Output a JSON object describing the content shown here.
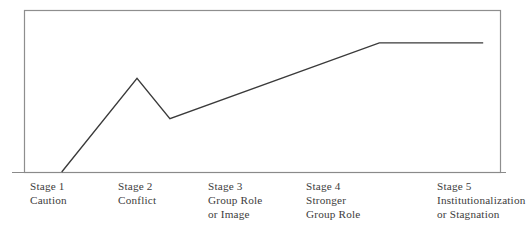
{
  "figure": {
    "background_color": "#ffffff",
    "frame_color": "#8e8e8e",
    "curve_color": "#3a3a3a",
    "axis_color": "#8a8a8a",
    "text_color": "#3d3c3c"
  },
  "chart_data": {
    "type": "line",
    "title": "",
    "subtitle": "",
    "xlabel": "",
    "ylabel": "",
    "grid": false,
    "legend": "none",
    "xlim": [
      0,
      5.5
    ],
    "ylim": [
      0,
      100
    ],
    "categories": [
      "Stage 1",
      "Stage 2",
      "Stage 3",
      "Stage 4",
      "Stage 5"
    ],
    "annotations": [
      "Caution",
      "Conflict",
      "Group Role or Image",
      "Stronger Group Role",
      "Institutionalization or Stagnation"
    ],
    "series": [
      {
        "name": "Group development",
        "points": [
          {
            "label": "Stage 1 start",
            "x": 0.43,
            "y": 0
          },
          {
            "label": "Stage 2 peak",
            "x": 1.3,
            "y": 58
          },
          {
            "label": "Post-conflict dip",
            "x": 1.68,
            "y": 33
          },
          {
            "label": "Stage 4 plateau start",
            "x": 4.1,
            "y": 80
          },
          {
            "label": "Stage 5 plateau end",
            "x": 5.3,
            "y": 80
          }
        ]
      }
    ]
  },
  "stages": [
    {
      "name": "Stage 1",
      "desc_lines": [
        "Caution"
      ]
    },
    {
      "name": "Stage 2",
      "desc_lines": [
        "Conflict"
      ]
    },
    {
      "name": "Stage 3",
      "desc_lines": [
        "Group Role",
        "or Image"
      ]
    },
    {
      "name": "Stage 4",
      "desc_lines": [
        "Stronger",
        "Group Role"
      ]
    },
    {
      "name": "Stage 5",
      "desc_lines": [
        "Institutionalization",
        "or Stagnation"
      ]
    }
  ]
}
